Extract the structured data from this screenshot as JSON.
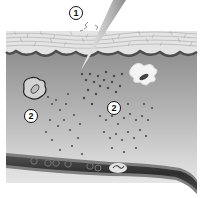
{
  "diagram": {
    "labels": [
      {
        "id": "1",
        "text": "1",
        "x": 69,
        "y": 6
      },
      {
        "id": "2a",
        "text": "2",
        "x": 24,
        "y": 109
      },
      {
        "id": "2b",
        "text": "2",
        "x": 107,
        "y": 101
      }
    ],
    "colors": {
      "background": "#ffffff",
      "epidermis": "#e2e2e2",
      "epidermis_lines": "#9a9a9a",
      "basal_layer": "#5a5a5a",
      "dermis": "#a8a8a8",
      "dermis_light": "#c9c9c9",
      "particles": "#555555",
      "vessel_wall": "#8a8a8a",
      "vessel_lumen": "#3a3a3a",
      "needle": "#d8d8d8"
    },
    "parts": [
      "needle",
      "epidermis",
      "dermis",
      "immune-cell-left",
      "dendritic-cell",
      "particle-cloud-left",
      "particle-cloud-right",
      "blood-vessel"
    ]
  }
}
